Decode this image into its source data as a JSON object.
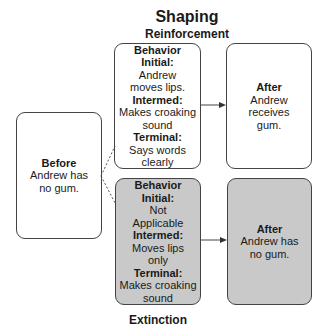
{
  "title": "Shaping",
  "top_label": "Reinforcement",
  "bottom_label": "Extinction",
  "colors": {
    "border": "#444444",
    "extinction_fill": "#c9c9c9",
    "background": "#ffffff"
  },
  "before": {
    "heading": "Before",
    "text": "Andrew has no gum."
  },
  "reinforcement": {
    "behavior": {
      "heading": "Behavior",
      "initial_label": "Initial:",
      "initial_text": "Andrew moves lips.",
      "intermed_label": "Intermed:",
      "intermed_text": "Makes croaking sound",
      "terminal_label": "Terminal:",
      "terminal_text": "Says words clearly"
    },
    "after": {
      "heading": "After",
      "text": "Andrew receives gum."
    }
  },
  "extinction": {
    "behavior": {
      "heading": "Behavior",
      "initial_label": "Initial:",
      "initial_text": "Not Applicable",
      "intermed_label": "Intermed:",
      "intermed_text": "Moves lips only",
      "terminal_label": "Terminal:",
      "terminal_text": "Makes croaking sound"
    },
    "after": {
      "heading": "After",
      "text": "Andrew has no gum."
    }
  }
}
